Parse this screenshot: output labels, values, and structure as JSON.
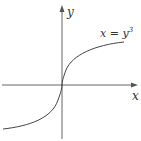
{
  "diagram": {
    "x_axis_label": "x",
    "y_axis_label": "y",
    "curve_label_lhs": "x = y",
    "curve_label_exp": "3",
    "colors": {
      "axis": "#555555",
      "curve": "#444444",
      "background": "#ffffff"
    }
  }
}
